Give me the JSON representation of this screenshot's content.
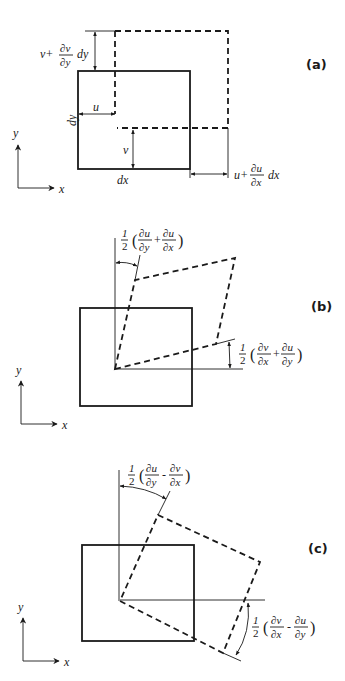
{
  "figure": {
    "panels": [
      {
        "id": "a",
        "label": "(a)",
        "axes": {
          "x": "x",
          "y": "y"
        },
        "labels": {
          "top_disp_prefix": "v+",
          "top_disp_num": "∂v",
          "top_disp_den": "∂y",
          "top_disp_suffix": "dy",
          "u": "u",
          "dy": "dy",
          "v": "v",
          "dx": "dx",
          "right_disp_prefix": "u+",
          "right_disp_num": "∂u",
          "right_disp_den": "∂x",
          "right_disp_suffix": "dx"
        }
      },
      {
        "id": "b",
        "label": "(b)",
        "axes": {
          "x": "x",
          "y": "y"
        },
        "labels": {
          "top_half": "1",
          "top_half_den": "2",
          "top_f1_num": "∂u",
          "top_f1_den": "∂y",
          "top_op": "+",
          "top_f2_num": "∂u",
          "top_f2_den": "∂x",
          "right_half": "1",
          "right_half_den": "2",
          "right_f1_num": "∂v",
          "right_f1_den": "∂x",
          "right_op": "+",
          "right_f2_num": "∂u",
          "right_f2_den": "∂y"
        }
      },
      {
        "id": "c",
        "label": "(c)",
        "axes": {
          "x": "x",
          "y": "y"
        },
        "labels": {
          "top_half": "1",
          "top_half_den": "2",
          "top_f1_num": "∂u",
          "top_f1_den": "∂y",
          "top_op": "-",
          "top_f2_num": "∂v",
          "top_f2_den": "∂x",
          "right_half": "1",
          "right_half_den": "2",
          "right_f1_num": "∂v",
          "right_f1_den": "∂x",
          "right_op": "-",
          "right_f2_num": "∂u",
          "right_f2_den": "∂y"
        }
      }
    ]
  }
}
